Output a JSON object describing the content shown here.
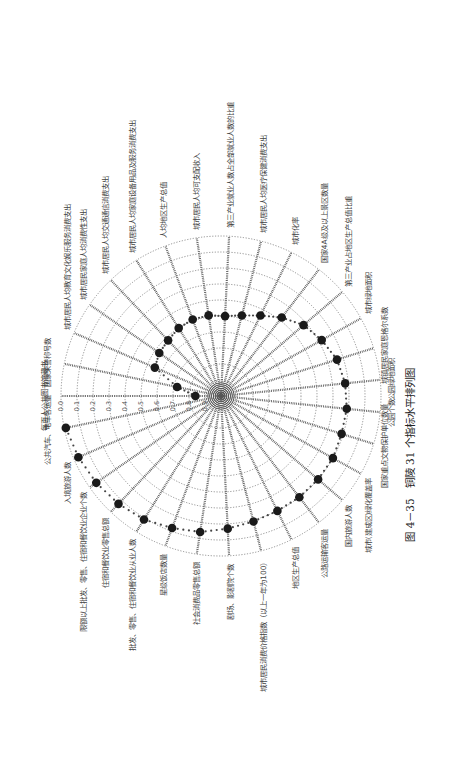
{
  "caption": "图 4－35　铜陵 31 个指标水平排列图",
  "chart_data": {
    "type": "radar",
    "title": "图 4－35　铜陵 31 个指标水平排列图",
    "orientation_note": "page rotated 90° counter-clockwise",
    "radial_ticks": [
      "0.0",
      "0.1",
      "0.2",
      "0.3",
      "0.4",
      "0.5",
      "0.6",
      "0.7",
      "0.8",
      "0.9"
    ],
    "radial_scale": "0.0 at outer ring, increasing toward center",
    "rings": 10,
    "grid": true,
    "categories": [
      "每百人公共图书馆藏书",
      "国家荣誉称号数",
      "城市居民人均教育文化娱乐服务消费支出",
      "城市居民家庭人均消费性支出",
      "城市居民人均交通通信消费支出",
      "城市居民人均家庭设备用品及服务消费支出",
      "人均地区生产总值",
      "城市居民人均可支配收入",
      "第三产业就业人数占全部就业人数的比重",
      "城市居民人均医疗保健消费支出",
      "城市化率",
      "国家4A级及以上景区数量",
      "第三产业占地区生产总值比重",
      "城市绿地面积",
      "城镇居民家庭恩格尔系数",
      "公园绿地面积",
      "公园个数",
      "国家重点文物保护单位数量",
      "城市(建成区)绿化覆盖率",
      "国内旅游人数",
      "公路运输客运量",
      "地区生产总值",
      "城市居民消费价格指数（以上一年为100）",
      "剧场、影剧院个数",
      "社会消费品零售总额",
      "星级饭店数量",
      "批发、零售、住宿和餐饮业从业人数",
      "住宿和餐饮业零售总额",
      "限额以上批发、零售、住宿和餐饮业企业个数",
      "入境旅游人数",
      "公共汽车、电车客运量"
    ],
    "values": [
      0.84,
      0.72,
      0.55,
      0.53,
      0.52,
      0.5,
      0.49,
      0.49,
      0.5,
      0.48,
      0.44,
      0.38,
      0.32,
      0.28,
      0.24,
      0.22,
      0.21,
      0.21,
      0.2,
      0.2,
      0.2,
      0.2,
      0.19,
      0.17,
      0.14,
      0.12,
      0.09,
      0.07,
      0.05,
      0.03,
      0.01
    ]
  },
  "style": {
    "dot_color": "#1a1a1a",
    "grid_color": "#777777",
    "background": "#ffffff"
  }
}
